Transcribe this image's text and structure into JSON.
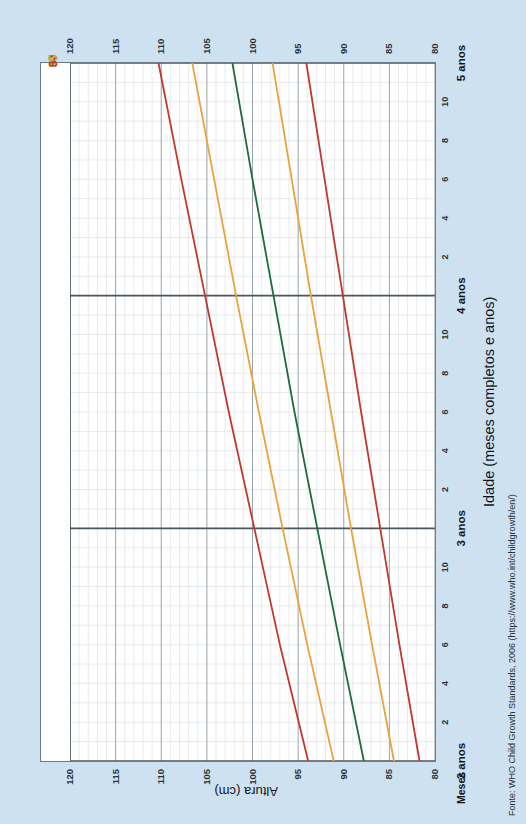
{
  "chart_data": {
    "type": "line",
    "title": "",
    "xlabel": "Idade (meses completos e anos)",
    "ylabel": "Altura (cm)",
    "xlim_months": [
      24,
      60
    ],
    "ylim": [
      80,
      120
    ],
    "grid": true,
    "legend_position": "inline-top",
    "y_ticks": [
      80,
      85,
      90,
      95,
      100,
      105,
      110,
      115,
      120
    ],
    "y_minor_step": 1,
    "x_major_labels": [
      "2 anos",
      "3 anos",
      "4 anos",
      "5 anos"
    ],
    "x_major_months": [
      24,
      36,
      48,
      60
    ],
    "x_minor_labels": [
      "2",
      "4",
      "6",
      "8",
      "10"
    ],
    "x_minor_axis_caption": "Meses",
    "series": [
      {
        "name": "97",
        "label": "97",
        "color": "#c0392b",
        "points_months": [
          24,
          30,
          36,
          42,
          48,
          54,
          60
        ],
        "points_cm": [
          93.9,
          97.0,
          99.8,
          102.6,
          105.2,
          107.8,
          110.3
        ],
        "start_cm_at_60": 120.0
      },
      {
        "name": "85",
        "label": "85",
        "color": "#e8a33d",
        "points_months": [
          24,
          30,
          36,
          42,
          48,
          54,
          60
        ],
        "points_cm": [
          91.1,
          94.0,
          96.7,
          99.3,
          101.8,
          104.2,
          106.6
        ],
        "start_cm_at_60": 115.4
      },
      {
        "name": "50",
        "label": "50",
        "color": "#1e6b3c",
        "points_months": [
          24,
          30,
          36,
          42,
          48,
          54,
          60
        ],
        "points_cm": [
          87.8,
          90.4,
          92.9,
          95.4,
          97.7,
          100.0,
          102.2
        ],
        "start_cm_at_60": 110.0
      },
      {
        "name": "15",
        "label": "15",
        "color": "#e8a33d",
        "points_months": [
          24,
          30,
          36,
          42,
          48,
          54,
          60
        ],
        "points_cm": [
          84.5,
          86.9,
          89.2,
          91.4,
          93.6,
          95.7,
          97.8
        ],
        "start_cm_at_60": 104.7
      },
      {
        "name": "3",
        "label": "3",
        "color": "#c0392b",
        "points_months": [
          24,
          30,
          36,
          42,
          48,
          54,
          60
        ],
        "points_cm": [
          81.7,
          83.9,
          86.0,
          88.1,
          90.1,
          92.1,
          94.1
        ],
        "start_cm_at_60": 100.1
      }
    ]
  },
  "axes": {
    "y_title": "Altura (cm)",
    "x_title": "Idade (meses completos e anos)",
    "months_caption": "Meses",
    "y_ticks": [
      "120",
      "115",
      "110",
      "105",
      "100",
      "95",
      "90",
      "85",
      "80"
    ],
    "year_labels": [
      "2 anos",
      "3 anos",
      "4 anos",
      "5 anos"
    ],
    "month_ticks": [
      "2",
      "4",
      "6",
      "8",
      "10"
    ]
  },
  "percentiles": [
    {
      "label": "97",
      "color": "#c0392b"
    },
    {
      "label": "85",
      "color": "#e8a33d"
    },
    {
      "label": "50",
      "color": "#1e6b3c"
    },
    {
      "label": "15",
      "color": "#e8a33d"
    },
    {
      "label": "3",
      "color": "#c0392b"
    }
  ],
  "source": {
    "text": "Fonte: WHO Child Growth Standards, 2006 (https://www.who.int/childgrowth/en/)"
  },
  "colors": {
    "page_background": "#cde1f1",
    "plot_background": "#ffffff",
    "axis_line": "#6d7b85",
    "major_grid": "#8d9aa4",
    "minor_grid": "#d7dde2",
    "year_divider": "#4b565e",
    "red": "#c0392b",
    "orange": "#e8a33d",
    "green": "#1e6b3c",
    "text": "#10161b"
  }
}
